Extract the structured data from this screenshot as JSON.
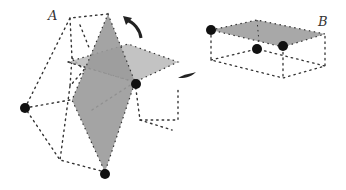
{
  "figure": {
    "label_a": "A",
    "label_b": "B",
    "colors": {
      "face_dark": "#9a9a9a",
      "face_light": "#b4b4b4",
      "edge": "#333333",
      "vertex": "#111111"
    }
  }
}
